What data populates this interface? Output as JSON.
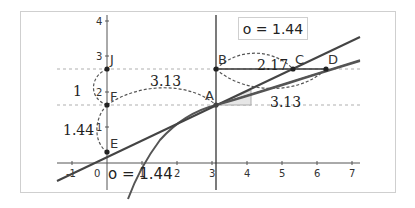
{
  "diagram": {
    "value_box": {
      "label": "o = 1.44"
    },
    "bottom_label": {
      "label": "o = 1.44"
    },
    "axes": {
      "x_ticks": [
        "-1",
        "0",
        "1",
        "2",
        "3",
        "4",
        "5",
        "6",
        "7"
      ],
      "y_ticks": [
        "1",
        "2",
        "3",
        "4"
      ]
    },
    "points": [
      {
        "name": "A",
        "label": "A"
      },
      {
        "name": "B",
        "label": "B"
      },
      {
        "name": "C",
        "label": "C"
      },
      {
        "name": "D",
        "label": "D"
      },
      {
        "name": "E",
        "label": "E"
      },
      {
        "name": "F",
        "label": "F"
      },
      {
        "name": "J",
        "label": "J"
      }
    ],
    "measures": {
      "jf": "1",
      "fe": "1.44",
      "fa": "3.13",
      "bc": "2.17",
      "ad": "3.13"
    },
    "colors": {
      "line": "#444444",
      "curve": "#555555",
      "dashed_guide": "#b0b0b0",
      "arc": "#555555",
      "triangle_fill": "#e6e6e6",
      "frame": "#cfcfcf"
    }
  }
}
